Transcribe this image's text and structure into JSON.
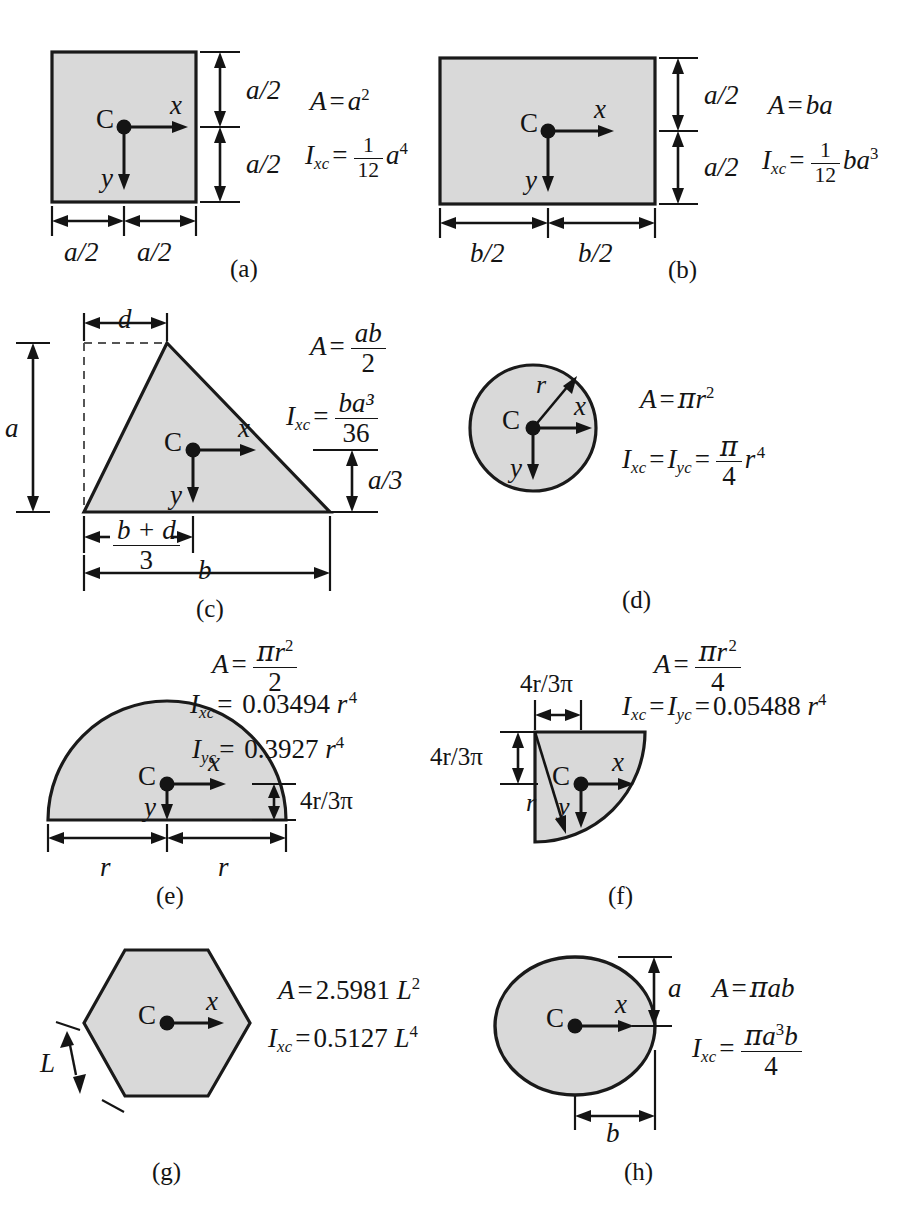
{
  "figure": {
    "fill_color": "#d9d9d9",
    "stroke_color": "#1a1a1a",
    "panels": [
      {
        "id": "a",
        "caption": "(a)",
        "shape": "square",
        "centroid_label": "C",
        "axis_x_label": "x",
        "axis_y_label": "y",
        "dimensions": {
          "vertical_top": "a/2",
          "vertical_bottom": "a/2",
          "horizontal_left": "a/2",
          "horizontal_right": "a/2"
        },
        "area_lhs": "A",
        "area_rhs": "a²",
        "inertia_lhs": "I",
        "inertia_sub": "xc",
        "inertia_frac_num": "1",
        "inertia_frac_den": "12",
        "inertia_tail": "a⁴"
      },
      {
        "id": "b",
        "caption": "(b)",
        "shape": "rectangle",
        "centroid_label": "C",
        "axis_x_label": "x",
        "axis_y_label": "y",
        "dimensions": {
          "vertical_top": "a/2",
          "vertical_bottom": "a/2",
          "horizontal_left": "b/2",
          "horizontal_right": "b/2"
        },
        "area_lhs": "A",
        "area_rhs": "ba",
        "inertia_lhs": "I",
        "inertia_sub": "xc",
        "inertia_frac_num": "1",
        "inertia_frac_den": "12",
        "inertia_tail": "ba³"
      },
      {
        "id": "c",
        "caption": "(c)",
        "shape": "triangle",
        "centroid_label": "C",
        "axis_x_label": "x",
        "axis_y_label": "y",
        "dimensions": {
          "apex_offset": "d",
          "height": "a",
          "centroid_height": "a/3",
          "centroid_offset_num": "b + d",
          "centroid_offset_den": "3",
          "base": "b"
        },
        "area_lhs": "A",
        "area_num": "ab",
        "area_den": "2",
        "inertia_lhs": "I",
        "inertia_sub": "xc",
        "inertia_num": "ba³",
        "inertia_den": "36"
      },
      {
        "id": "d",
        "caption": "(d)",
        "shape": "circle",
        "centroid_label": "C",
        "axis_x_label": "x",
        "axis_y_label": "y",
        "radius_label": "r",
        "area_lhs": "A",
        "area_rhs": "πr²",
        "inertia_lhs_1": "I",
        "inertia_sub_1": "xc",
        "inertia_lhs_2": "I",
        "inertia_sub_2": "yc",
        "inertia_frac_num": "π",
        "inertia_frac_den": "4",
        "inertia_tail": "r⁴"
      },
      {
        "id": "e",
        "caption": "(e)",
        "shape": "semicircle",
        "centroid_label": "C",
        "axis_x_label": "x",
        "axis_y_label": "y",
        "dimensions": {
          "centroid_height": "4r/3π",
          "radius_left": "r",
          "radius_right": "r"
        },
        "area_lhs": "A",
        "area_num": "πr²",
        "area_den": "2",
        "inertia_x_lhs": "I",
        "inertia_x_sub": "xc",
        "inertia_x_value": "0.03494",
        "inertia_x_tail": "r⁴",
        "inertia_y_lhs": "I",
        "inertia_y_sub": "yc",
        "inertia_y_value": "0.3927",
        "inertia_y_tail": "r⁴"
      },
      {
        "id": "f",
        "caption": "(f)",
        "shape": "quarter-circle",
        "centroid_label": "C",
        "axis_x_label": "x",
        "axis_y_label": "y",
        "radius_label": "r",
        "dimensions": {
          "centroid_offset_x": "4r/3π",
          "centroid_offset_y": "4r/3π"
        },
        "area_lhs": "A",
        "area_num": "πr²",
        "area_den": "4",
        "inertia_lhs_1": "I",
        "inertia_sub_1": "xc",
        "inertia_lhs_2": "I",
        "inertia_sub_2": "yc",
        "inertia_value": "0.05488",
        "inertia_tail": "r⁴"
      },
      {
        "id": "g",
        "caption": "(g)",
        "shape": "hexagon",
        "centroid_label": "C",
        "axis_x_label": "x",
        "side_label": "L",
        "area_lhs": "A",
        "area_value": "2.5981",
        "area_tail": "L²",
        "inertia_lhs": "I",
        "inertia_sub": "xc",
        "inertia_value": "0.5127",
        "inertia_tail": "L⁴"
      },
      {
        "id": "h",
        "caption": "(h)",
        "shape": "ellipse",
        "centroid_label": "C",
        "axis_x_label": "x",
        "dimensions": {
          "semi_minor": "a",
          "semi_major": "b"
        },
        "area_lhs": "A",
        "area_rhs": "πab",
        "inertia_lhs": "I",
        "inertia_sub": "xc",
        "inertia_num": "πa³b",
        "inertia_den": "4"
      }
    ]
  }
}
